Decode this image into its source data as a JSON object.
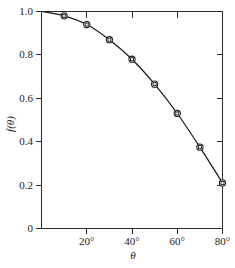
{
  "chart_data": {
    "type": "line",
    "title": "",
    "subtitle": "",
    "xlabel": "θ",
    "ylabel": "f(θ)",
    "x": [
      0,
      10,
      20,
      30,
      40,
      50,
      60,
      70,
      80
    ],
    "values": [
      1.0,
      0.98,
      0.94,
      0.87,
      0.78,
      0.665,
      0.53,
      0.375,
      0.21
    ],
    "series": [
      {
        "name": "f(θ)",
        "x": [
          0,
          10,
          20,
          30,
          40,
          50,
          60,
          70,
          80
        ],
        "values": [
          1.0,
          0.98,
          0.94,
          0.87,
          0.78,
          0.665,
          0.53,
          0.375,
          0.21
        ],
        "marker": "circle-with-square",
        "line_color": "#1a1a1a"
      }
    ],
    "markers_at_x": [
      10,
      20,
      30,
      40,
      50,
      60,
      70,
      80
    ],
    "xlim": [
      0,
      85
    ],
    "ylim": [
      0,
      1.05
    ],
    "xticks": [
      0,
      20,
      40,
      60,
      80
    ],
    "xtick_labels": [
      "0",
      "20°",
      "40°",
      "60°",
      "80°"
    ],
    "yticks": [
      0,
      0.2,
      0.4,
      0.6,
      0.8,
      1.0
    ],
    "ytick_labels": [
      "0",
      "0.2",
      "0.4",
      "0.6",
      "0.8",
      "1.0"
    ],
    "grid": false,
    "legend": null,
    "legend_position": "none",
    "annotations": [],
    "frame": "box",
    "tick_direction_top_right": "in",
    "tick_direction_left_bottom": "out",
    "line_color": "#1a1a1a",
    "background_color": "#ffffff"
  },
  "axes": {
    "y_title": "f(θ)",
    "x_title": "θ",
    "y_labels": [
      "1.0",
      "0.8",
      "0.6",
      "0.4",
      "0.2",
      "0"
    ],
    "x_labels": [
      "0",
      "20°",
      "40°",
      "60°",
      "80°"
    ]
  }
}
